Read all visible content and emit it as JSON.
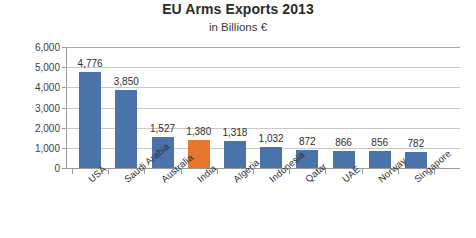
{
  "chart_data": {
    "type": "bar",
    "title": "EU Arms Exports 2013",
    "subtitle": "in Billions €",
    "xlabel": "",
    "ylabel": "Billions €",
    "ylim": [
      0,
      6000
    ],
    "ytick_labels": [
      "6,000",
      "5,000",
      "4,000",
      "3,000",
      "2,000",
      "1,000",
      "0"
    ],
    "ytick_values": [
      6000,
      5000,
      4000,
      3000,
      2000,
      1000,
      0
    ],
    "grid": true,
    "legend": "none",
    "categories": [
      "USA",
      "Saudi Arabia",
      "Australia",
      "India",
      "Algeria",
      "Indonesia",
      "Qatar",
      "UAE",
      "Norway",
      "Singapore"
    ],
    "values": [
      4776,
      3850,
      1527,
      1380,
      1318,
      1032,
      872,
      866,
      856,
      782
    ],
    "value_labels": [
      "4,776",
      "3,850",
      "1,527",
      "1,380",
      "1,318",
      "1,032",
      "872",
      "866",
      "856",
      "782"
    ],
    "bar_colors": [
      "#4a72ab",
      "#4a72ab",
      "#4a72ab",
      "#e8762c",
      "#4a72ab",
      "#4a72ab",
      "#4a72ab",
      "#4a72ab",
      "#4a72ab",
      "#4a72ab"
    ],
    "highlight_category": "India",
    "colors": {
      "series_default": "#4a72ab",
      "series_highlight": "#e8762c",
      "gridline": "#c9c9c9",
      "axis": "#9a9a9a",
      "text": "#2e2e2e",
      "background": "#ffffff"
    }
  }
}
